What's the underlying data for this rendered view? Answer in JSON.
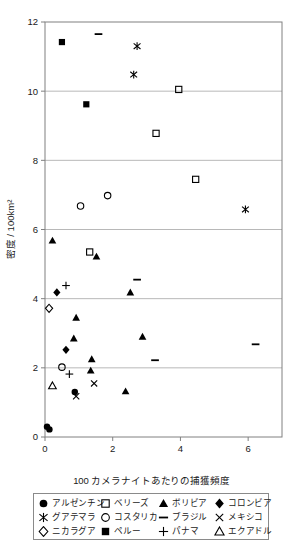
{
  "chart_data": {
    "type": "scatter",
    "title": "",
    "xlabel": "100 カメラナイトあたりの捕獲頻度",
    "ylabel": "密度 / 100km²",
    "xlim": [
      0,
      7
    ],
    "ylim": [
      0,
      12
    ],
    "xticks": [
      0,
      2,
      4,
      6
    ],
    "yticks": [
      0,
      2,
      4,
      6,
      8,
      10,
      12
    ],
    "grid": "horizontal",
    "legend_position": "below-axis",
    "series": [
      {
        "name": "アルゼンチン",
        "marker": "filled-circle",
        "points": [
          {
            "x": 0.06,
            "y": 0.3
          },
          {
            "x": 0.13,
            "y": 0.22
          },
          {
            "x": 0.88,
            "y": 1.3
          }
        ]
      },
      {
        "name": "ベリーズ",
        "marker": "open-square",
        "points": [
          {
            "x": 3.95,
            "y": 10.05
          },
          {
            "x": 3.28,
            "y": 8.78
          },
          {
            "x": 4.45,
            "y": 7.45
          },
          {
            "x": 1.32,
            "y": 5.35
          }
        ]
      },
      {
        "name": "ボリビア",
        "marker": "filled-triangle",
        "points": [
          {
            "x": 0.22,
            "y": 5.68
          },
          {
            "x": 1.52,
            "y": 5.22
          },
          {
            "x": 2.52,
            "y": 4.18
          },
          {
            "x": 0.92,
            "y": 3.45
          },
          {
            "x": 0.85,
            "y": 2.85
          },
          {
            "x": 2.88,
            "y": 2.9
          },
          {
            "x": 1.38,
            "y": 2.25
          },
          {
            "x": 1.35,
            "y": 1.92
          },
          {
            "x": 2.38,
            "y": 1.32
          }
        ]
      },
      {
        "name": "コロンビア",
        "marker": "filled-diamond",
        "points": [
          {
            "x": 0.35,
            "y": 4.18
          },
          {
            "x": 0.62,
            "y": 2.52
          }
        ]
      },
      {
        "name": "グアテマラ",
        "marker": "asterisk",
        "points": [
          {
            "x": 2.72,
            "y": 11.3
          },
          {
            "x": 2.62,
            "y": 10.48
          },
          {
            "x": 5.92,
            "y": 6.58
          }
        ]
      },
      {
        "name": "コスタリカ",
        "marker": "open-circle",
        "points": [
          {
            "x": 1.05,
            "y": 6.68
          },
          {
            "x": 1.85,
            "y": 6.98
          },
          {
            "x": 0.5,
            "y": 2.02
          }
        ]
      },
      {
        "name": "ブラジル",
        "marker": "dash",
        "points": [
          {
            "x": 1.58,
            "y": 11.65
          },
          {
            "x": 2.72,
            "y": 4.55
          },
          {
            "x": 6.22,
            "y": 2.68
          },
          {
            "x": 3.25,
            "y": 2.22
          }
        ]
      },
      {
        "name": "メキシコ",
        "marker": "cross-x",
        "points": [
          {
            "x": 1.45,
            "y": 1.55
          },
          {
            "x": 0.92,
            "y": 1.18
          }
        ]
      },
      {
        "name": "ニカラグア",
        "marker": "open-diamond",
        "points": [
          {
            "x": 0.12,
            "y": 3.72
          }
        ]
      },
      {
        "name": "ペルー",
        "marker": "filled-square",
        "points": [
          {
            "x": 0.5,
            "y": 11.42
          },
          {
            "x": 1.22,
            "y": 9.62
          }
        ]
      },
      {
        "name": "パナマ",
        "marker": "plus",
        "points": [
          {
            "x": 0.62,
            "y": 4.38
          },
          {
            "x": 0.72,
            "y": 1.82
          }
        ]
      },
      {
        "name": "エクアドル",
        "marker": "open-triangle",
        "points": [
          {
            "x": 0.22,
            "y": 1.48
          }
        ]
      }
    ]
  },
  "axes": {
    "y_title": "密度 / 100km²",
    "x_title": "100 カメラナイトあたりの捕獲頻度",
    "y_tick_labels": [
      "0",
      "2",
      "4",
      "6",
      "8",
      "10",
      "12"
    ],
    "x_tick_labels": [
      "0",
      "2",
      "4",
      "6"
    ]
  },
  "legend": {
    "items": [
      {
        "label": "アルゼンチン",
        "marker": "filled-circle"
      },
      {
        "label": "ベリーズ",
        "marker": "open-square"
      },
      {
        "label": "ボリビア",
        "marker": "filled-triangle"
      },
      {
        "label": "コロンビア",
        "marker": "filled-diamond"
      },
      {
        "label": "グアテマラ",
        "marker": "asterisk"
      },
      {
        "label": "コスタリカ",
        "marker": "open-circle"
      },
      {
        "label": "ブラジル",
        "marker": "dash"
      },
      {
        "label": "メキシコ",
        "marker": "cross-x"
      },
      {
        "label": "ニカラグア",
        "marker": "open-diamond"
      },
      {
        "label": "ペルー",
        "marker": "filled-square"
      },
      {
        "label": "パナマ",
        "marker": "plus"
      },
      {
        "label": "エクアドル",
        "marker": "open-triangle"
      }
    ]
  },
  "colors": {
    "marker": "#000000",
    "grid": "#b0b0b0",
    "frame": "#808080",
    "background": "#ffffff"
  }
}
